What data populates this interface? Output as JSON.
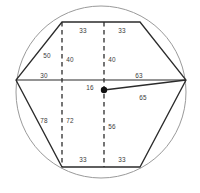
{
  "figure": {
    "kind": "geometry-diagram",
    "canvas": {
      "width": 200,
      "height": 193,
      "background": "#ffffff"
    },
    "colors": {
      "circle_stroke": "#9a9a9a",
      "polygon_stroke": "#2b2b2b",
      "dashed_stroke": "#2b2b2b",
      "center_dot": "#111111",
      "label_text": "#3a3a3a"
    },
    "circle": {
      "cx": 101,
      "cy": 92,
      "rx": 85,
      "ry": 86
    },
    "center_point": {
      "x": 104,
      "y": 90,
      "radius": 3.2
    },
    "polygon_vertices": [
      {
        "name": "top-left",
        "x": 62,
        "y": 22
      },
      {
        "name": "top-right",
        "x": 140,
        "y": 22
      },
      {
        "name": "right",
        "x": 186,
        "y": 80
      },
      {
        "name": "bottom-right",
        "x": 140,
        "y": 167
      },
      {
        "name": "bottom-left",
        "x": 62,
        "y": 167
      },
      {
        "name": "left",
        "x": 16,
        "y": 80
      }
    ],
    "diameter_line": {
      "x1": 16,
      "y1": 80,
      "x2": 186,
      "y2": 80
    },
    "radius_line": {
      "x1": 104,
      "y1": 90,
      "x2": 186,
      "y2": 80
    },
    "dashed_lines": [
      {
        "name": "dashed-left",
        "x": 62,
        "y1": 22,
        "y2": 167
      },
      {
        "name": "dashed-center",
        "x": 104,
        "y1": 22,
        "y2": 167
      }
    ],
    "labels": [
      {
        "id": "top-left-33",
        "text": "33",
        "x": 83,
        "y": 31
      },
      {
        "id": "top-right-33",
        "text": "33",
        "x": 122,
        "y": 31
      },
      {
        "id": "upper-left-50",
        "text": "50",
        "x": 47,
        "y": 56
      },
      {
        "id": "upper-left-40",
        "text": "40",
        "x": 70,
        "y": 60
      },
      {
        "id": "upper-right-40",
        "text": "40",
        "x": 112,
        "y": 60
      },
      {
        "id": "mid-left-30",
        "text": "30",
        "x": 44,
        "y": 76
      },
      {
        "id": "mid-right-63",
        "text": "63",
        "x": 139,
        "y": 76
      },
      {
        "id": "center-16",
        "text": "16",
        "x": 90,
        "y": 88
      },
      {
        "id": "radius-65",
        "text": "65",
        "x": 143,
        "y": 98
      },
      {
        "id": "lower-left-78",
        "text": "78",
        "x": 44,
        "y": 121
      },
      {
        "id": "lower-left-72",
        "text": "72",
        "x": 70,
        "y": 121
      },
      {
        "id": "lower-center-56",
        "text": "56",
        "x": 112,
        "y": 127
      },
      {
        "id": "bottom-left-33",
        "text": "33",
        "x": 83,
        "y": 160
      },
      {
        "id": "bottom-right-33",
        "text": "33",
        "x": 122,
        "y": 160
      }
    ]
  }
}
